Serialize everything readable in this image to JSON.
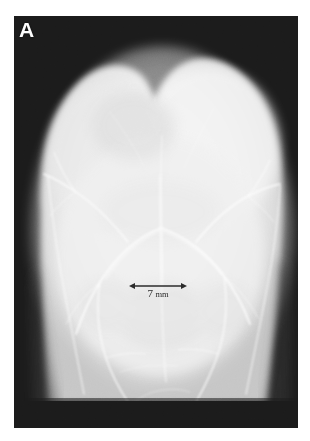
{
  "figure": {
    "type": "radiograph",
    "modality": "x-ray",
    "panel_label": "A",
    "background_color": "#1b1b1b",
    "bone_color": "#f1f1f1",
    "annotation_color": "#2b2b2b",
    "label_color": "#fdfdfd"
  },
  "scalebar": {
    "value": "7",
    "unit": "mm",
    "full_label": "7 mm",
    "style": "double-headed-arrow",
    "length_px": 56
  }
}
